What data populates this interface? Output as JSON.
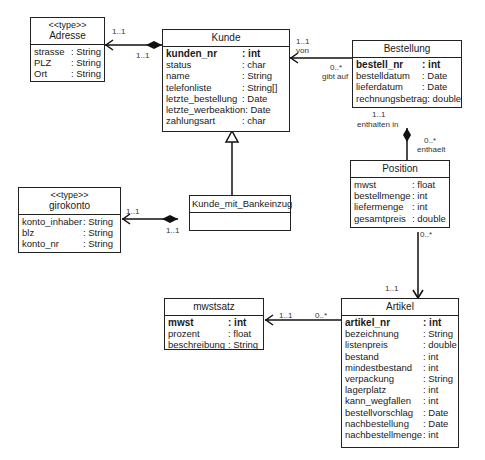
{
  "classes": {
    "adresse": {
      "stereotype": "<<type>>",
      "name": "Adresse",
      "attributes": [
        {
          "name": "strasse",
          "type": ": String"
        },
        {
          "name": "PLZ",
          "type": ": String"
        },
        {
          "name": "Ort",
          "type": ": String"
        }
      ]
    },
    "kunde": {
      "name": "Kunde",
      "attributes": [
        {
          "name": "kunden_nr",
          "type": ": int",
          "key": true
        },
        {
          "name": "status",
          "type": ": char"
        },
        {
          "name": "name",
          "type": ": String"
        },
        {
          "name": "telefonliste",
          "type": ": String[]"
        },
        {
          "name": "letzte_bestellung",
          "type": ": Date"
        },
        {
          "name": "letzte_werbeaktion",
          "type": ": Date"
        },
        {
          "name": "zahlungsart",
          "type": ": char"
        }
      ]
    },
    "bestellung": {
      "name": "Bestellung",
      "attributes": [
        {
          "name": "bestell_nr",
          "type": ": int",
          "key": true
        },
        {
          "name": "bestelldatum",
          "type": ": Date"
        },
        {
          "name": "lieferdatum",
          "type": ": Date"
        },
        {
          "name": "rechnungsbetrag",
          "type": ": double"
        }
      ]
    },
    "position": {
      "name": "Position",
      "attributes": [
        {
          "name": "mwst",
          "type": ": float"
        },
        {
          "name": "bestellmenge",
          "type": ": int"
        },
        {
          "name": "liefermenge",
          "type": ": int"
        },
        {
          "name": "gesamtpreis",
          "type": ": double"
        }
      ]
    },
    "girokonto": {
      "stereotype": "<<type>>",
      "name": "girokonto",
      "attributes": [
        {
          "name": "konto_inhaber",
          "type": ": String"
        },
        {
          "name": "blz",
          "type": ": String"
        },
        {
          "name": "konto_nr",
          "type": ": String"
        }
      ]
    },
    "kunde_mit_bankeinzug": {
      "name": "Kunde_mit_Bankeinzug",
      "attributes": []
    },
    "mwstsatz": {
      "name": "mwstsatz",
      "attributes": [
        {
          "name": "mwst",
          "type": ": int",
          "key": true
        },
        {
          "name": "prozent",
          "type": ": float"
        },
        {
          "name": "beschreibung",
          "type": ": String"
        }
      ]
    },
    "artikel": {
      "name": "Artikel",
      "attributes": [
        {
          "name": "artikel_nr",
          "type": ": int",
          "key": true
        },
        {
          "name": "bezeichnung",
          "type": ": String"
        },
        {
          "name": "listenpreis",
          "type": ": double"
        },
        {
          "name": "bestand",
          "type": ": int"
        },
        {
          "name": "mindestbestand",
          "type": ": int"
        },
        {
          "name": "verpackung",
          "type": ": String"
        },
        {
          "name": "lagerplatz",
          "type": ": int"
        },
        {
          "name": "kann_wegfallen",
          "type": ": int"
        },
        {
          "name": "bestellvorschlag",
          "type": ": Date"
        },
        {
          "name": "nachbestellung",
          "type": ": Date"
        },
        {
          "name": "nachbestellmenge",
          "type": ": int"
        }
      ]
    }
  },
  "associations": {
    "kunde_adresse": {
      "near_adresse": "1..1",
      "near_kunde": "1..1"
    },
    "bestellung_kunde": {
      "near_kunde": "1..1",
      "near_kunde_role": "von",
      "near_bestellung": "0..*",
      "near_bestellung_role": "gibt auf"
    },
    "bestellung_position": {
      "near_bestellung": "1..1",
      "near_bestellung_role": "enthalten in",
      "near_position": "0..*",
      "near_position_role": "enthaelt"
    },
    "position_artikel": {
      "near_position": "0..*",
      "near_artikel": "1..1"
    },
    "kmb_girokonto": {
      "near_girokonto": "1..1",
      "near_kmb": "1..1"
    },
    "artikel_mwstsatz": {
      "near_mwstsatz": "1..1",
      "near_artikel": "0..*"
    }
  }
}
